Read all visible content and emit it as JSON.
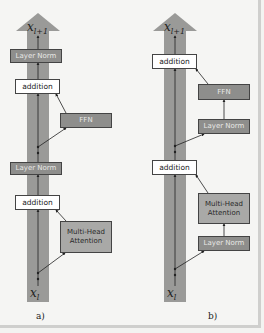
{
  "panels": [
    {
      "id": "a",
      "caption": "a)",
      "output_label": {
        "base": "x",
        "sub": "l+1"
      },
      "input_label": {
        "base": "x",
        "sub": "l"
      },
      "blocks": [
        {
          "label": "Layer Norm",
          "style": "dark"
        },
        {
          "label": "addition",
          "style": "white"
        },
        {
          "label": "FFN",
          "style": "dark"
        },
        {
          "label": "Layer Norm",
          "style": "dark"
        },
        {
          "label": "addition",
          "style": "white"
        },
        {
          "label": "Multi-Head Attention",
          "style": "mid"
        }
      ]
    },
    {
      "id": "b",
      "caption": "b)",
      "output_label": {
        "base": "x",
        "sub": "l+1"
      },
      "input_label": {
        "base": "x",
        "sub": "l"
      },
      "blocks": [
        {
          "label": "addition",
          "style": "white"
        },
        {
          "label": "FFN",
          "style": "dark"
        },
        {
          "label": "Layer Norm",
          "style": "dark"
        },
        {
          "label": "addition",
          "style": "white"
        },
        {
          "label": "Multi-Head Attention",
          "style": "mid"
        },
        {
          "label": "Layer Norm",
          "style": "dark"
        }
      ]
    }
  ],
  "colors": {
    "residual_stream": "#9a9a98",
    "block_dark": "#8e8e8c",
    "block_mid": "#a9a9a7",
    "block_white": "#ffffff",
    "line": "#222222"
  }
}
